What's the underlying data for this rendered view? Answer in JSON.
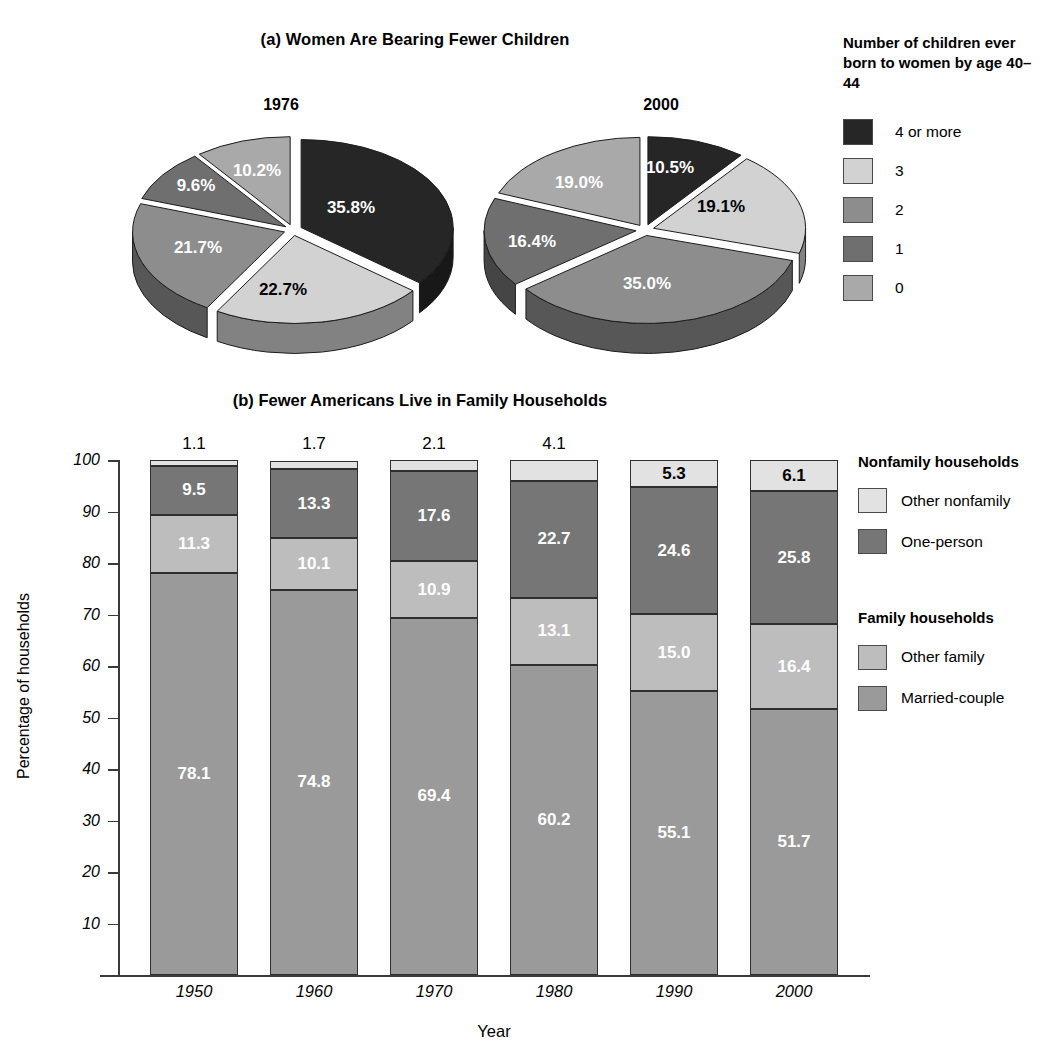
{
  "panel_a": {
    "title": "(a) Women Are Bearing Fewer Children",
    "legend": {
      "title": "Number of children ever born to women by age 40–44",
      "items": [
        {
          "label": "4 or more",
          "color": "#262626"
        },
        {
          "label": "3",
          "color": "#d2d2d2"
        },
        {
          "label": "2",
          "color": "#8d8d8d"
        },
        {
          "label": "1",
          "color": "#6f6f6f"
        },
        {
          "label": "0",
          "color": "#a9a9a9"
        }
      ]
    },
    "pies": [
      {
        "year": "1976",
        "labels": [
          "35.8%",
          "22.7%",
          "21.7%",
          "9.6%",
          "10.2%"
        ]
      },
      {
        "year": "2000",
        "labels": [
          "10.5%",
          "19.1%",
          "35.0%",
          "16.4%",
          "19.0%"
        ]
      }
    ]
  },
  "panel_b": {
    "title": "(b) Fewer Americans Live in Family Households",
    "legend": {
      "groups": [
        {
          "title": "Nonfamily households",
          "items": [
            {
              "label": "Other nonfamily",
              "color": "#e2e2e2"
            },
            {
              "label": "One-person",
              "color": "#767676"
            }
          ]
        },
        {
          "title": "Family households",
          "items": [
            {
              "label": "Other family",
              "color": "#bdbdbd"
            },
            {
              "label": "Married-couple",
              "color": "#9a9a9a"
            }
          ]
        }
      ]
    }
  },
  "chart_data": [
    {
      "type": "pie",
      "title": "1976",
      "labels": [
        "4 or more",
        "3",
        "2",
        "1",
        "0"
      ],
      "values": [
        35.8,
        22.7,
        21.7,
        9.6,
        10.2
      ],
      "data_labels": [
        "35.8%",
        "22.7%",
        "21.7%",
        "9.6%",
        "10.2%"
      ],
      "colors": [
        "#262626",
        "#d2d2d2",
        "#8d8d8d",
        "#6f6f6f",
        "#a9a9a9"
      ],
      "legend_title": "Number of children ever born to women by age 40–44",
      "legend_position": "right",
      "exploded": true,
      "three_d": true
    },
    {
      "type": "pie",
      "title": "2000",
      "labels": [
        "4 or more",
        "3",
        "2",
        "1",
        "0"
      ],
      "values": [
        10.5,
        19.1,
        35.0,
        16.4,
        19.0
      ],
      "data_labels": [
        "10.5%",
        "19.1%",
        "35.0%",
        "16.4%",
        "19.0%"
      ],
      "colors": [
        "#262626",
        "#d2d2d2",
        "#8d8d8d",
        "#6f6f6f",
        "#a9a9a9"
      ],
      "legend_title": "Number of children ever born to women by age 40–44",
      "legend_position": "right",
      "exploded": true,
      "three_d": true
    },
    {
      "type": "bar",
      "subtype": "stacked",
      "title": "(b) Fewer Americans Live in Family Households",
      "xlabel": "Year",
      "ylabel": "Percentage of households",
      "categories": [
        "1950",
        "1960",
        "1970",
        "1980",
        "1990",
        "2000"
      ],
      "ylim": [
        0,
        100
      ],
      "yticks": [
        10,
        20,
        30,
        40,
        50,
        60,
        70,
        80,
        90,
        100
      ],
      "grid": false,
      "legend_position": "right",
      "series": [
        {
          "name": "Married-couple",
          "color": "#9a9a9a",
          "values": [
            78.1,
            74.8,
            69.4,
            60.2,
            55.1,
            51.7
          ]
        },
        {
          "name": "Other family",
          "color": "#bdbdbd",
          "values": [
            11.3,
            10.1,
            10.9,
            13.1,
            15.0,
            16.4
          ]
        },
        {
          "name": "One-person",
          "color": "#767676",
          "values": [
            9.5,
            13.3,
            17.6,
            22.7,
            24.6,
            25.8
          ]
        },
        {
          "name": "Other nonfamily",
          "color": "#e2e2e2",
          "values": [
            1.1,
            1.7,
            2.1,
            4.1,
            5.3,
            6.1
          ]
        }
      ]
    }
  ]
}
